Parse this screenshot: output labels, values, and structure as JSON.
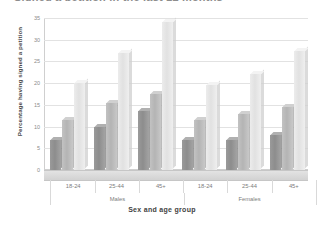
{
  "chart_data": {
    "type": "bar",
    "title": "Signed a petition in the last 12 months",
    "xlabel": "Sex and age group",
    "ylabel": "Percentage having signed a petition",
    "categories": [
      "18-24",
      "25-44",
      "45+",
      "18-24",
      "25-44",
      "45+"
    ],
    "group_labels": [
      "Males",
      "Females"
    ],
    "ylim": [
      0,
      35
    ],
    "yticks": [
      "0",
      "5",
      "10",
      "15",
      "20",
      "25",
      "30",
      "35"
    ],
    "grid": true,
    "legend": "none",
    "series": [
      {
        "name": "series-1",
        "color": "#8d8d8d",
        "values": [
          7,
          10,
          13.5,
          7,
          7,
          8
        ]
      },
      {
        "name": "series-2",
        "color": "#b4b4b4",
        "values": [
          11.5,
          15.5,
          17.5,
          11.5,
          13,
          14.5
        ]
      },
      {
        "name": "series-3",
        "color": "#e1e1e1",
        "values": [
          20,
          27,
          34,
          19.5,
          22,
          27.5
        ]
      }
    ]
  },
  "axis": {
    "y_title": "Percentage having signed a petition",
    "x_title": "Sex and age group",
    "y_ticks": [
      "35",
      "30",
      "25",
      "20",
      "15",
      "10",
      "5",
      "0"
    ]
  },
  "categories": [
    {
      "label": "18-24"
    },
    {
      "label": "25-44"
    },
    {
      "label": "45+"
    },
    {
      "label": "18-24"
    },
    {
      "label": "25-44"
    },
    {
      "label": "45+"
    }
  ],
  "sex_groups": [
    {
      "label": "Males"
    },
    {
      "label": "Females"
    }
  ],
  "title": "Signed a petition in the last 12 months"
}
